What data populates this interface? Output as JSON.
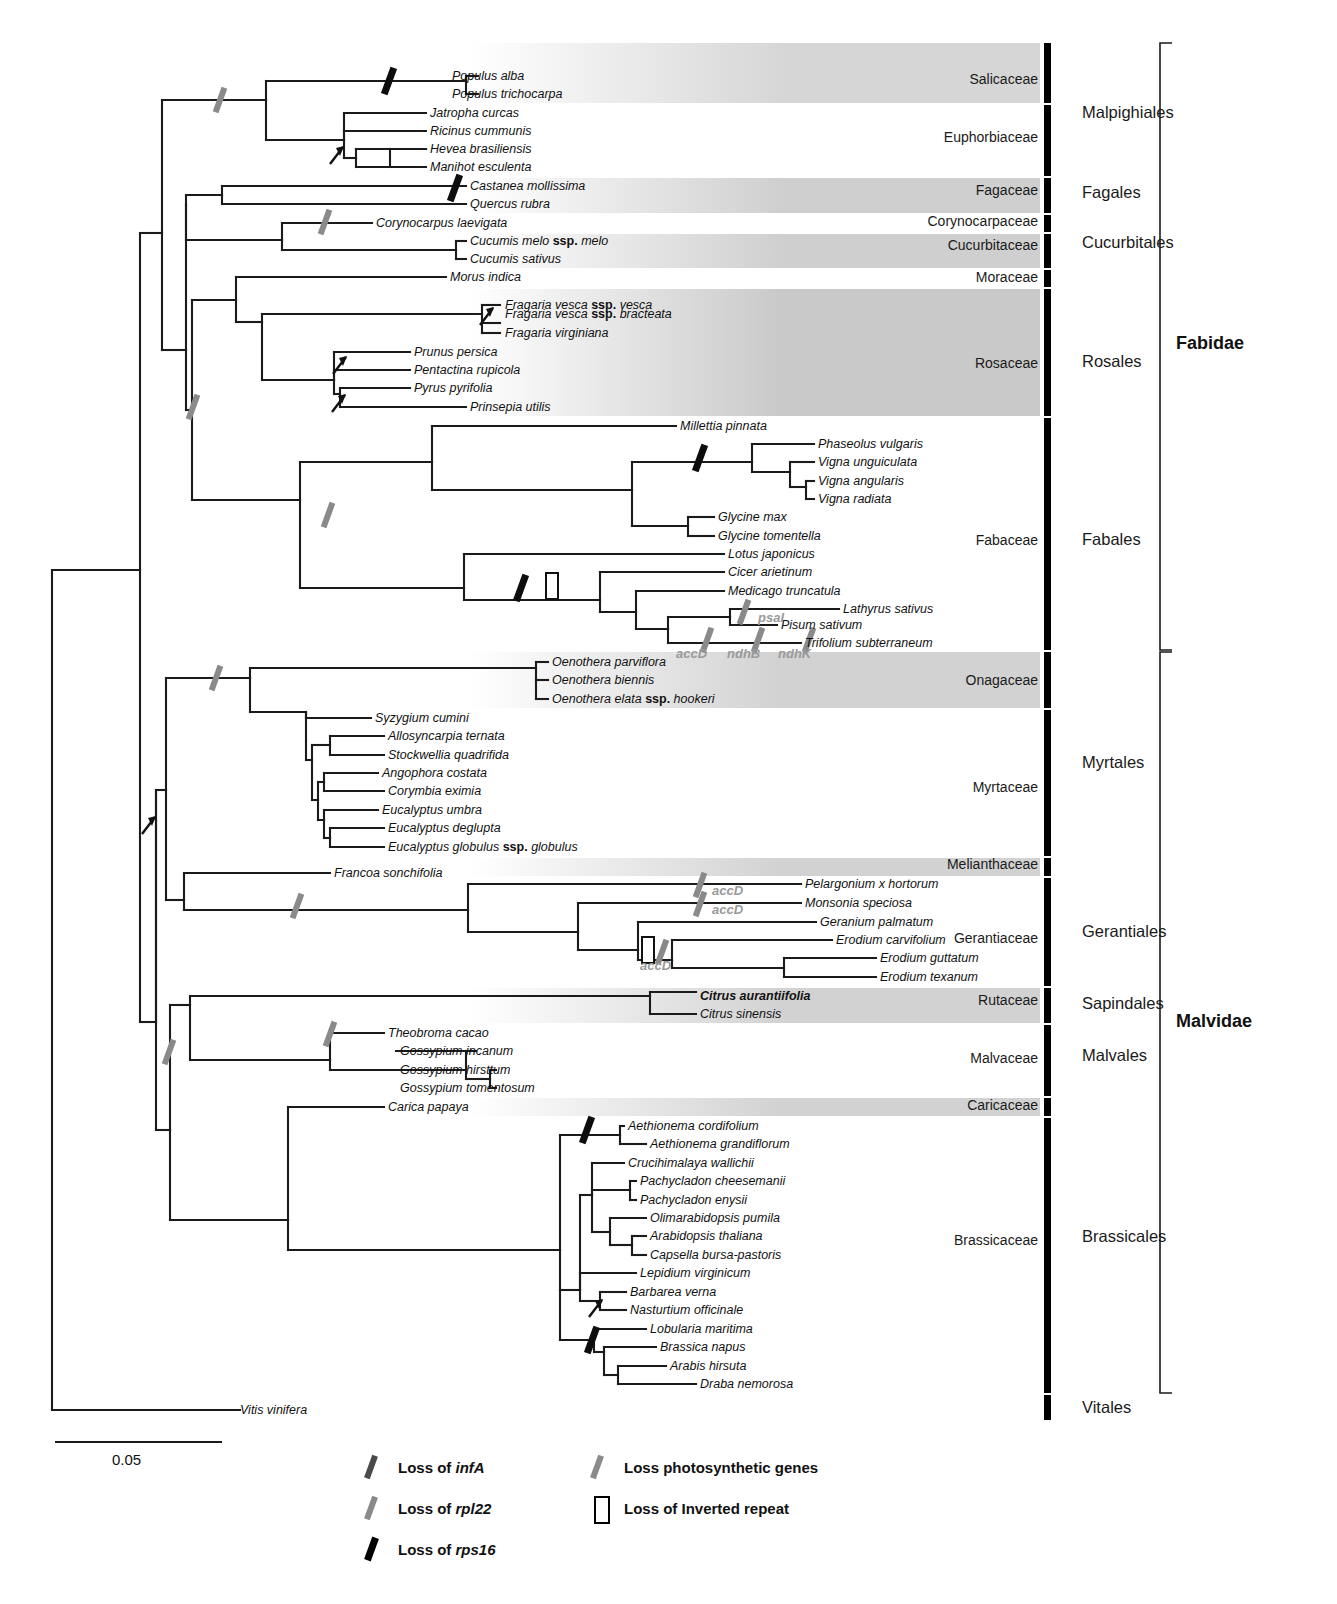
{
  "figure": {
    "type": "phylogenetic-tree",
    "scale_bar": {
      "label": "0.05",
      "x1": 55,
      "x2": 222,
      "y": 1442
    }
  },
  "tips": [
    {
      "name": "Populus alba",
      "x": 452,
      "y": 76,
      "bold": false
    },
    {
      "name": "Populus trichocarpa",
      "x": 452,
      "y": 94,
      "bold": false
    },
    {
      "name": "Jatropha curcas",
      "x": 430,
      "y": 113,
      "bold": false
    },
    {
      "name": "Ricinus cummunis",
      "x": 430,
      "y": 131,
      "bold": false
    },
    {
      "name": "Hevea brasiliensis",
      "x": 430,
      "y": 149,
      "bold": false
    },
    {
      "name": "Manihot esculenta",
      "x": 430,
      "y": 167,
      "bold": false
    },
    {
      "name": "Castanea mollissima",
      "x": 470,
      "y": 186,
      "bold": false
    },
    {
      "name": "Quercus rubra",
      "x": 470,
      "y": 204,
      "bold": false
    },
    {
      "name": "Corynocarpus laevigata",
      "x": 376,
      "y": 223,
      "bold": false
    },
    {
      "name": "Cucumis melo ssp. melo",
      "x": 470,
      "y": 241,
      "bold": false,
      "roman": "ssp."
    },
    {
      "name": "Cucumis sativus",
      "x": 470,
      "y": 259,
      "bold": false
    },
    {
      "name": "Morus indica",
      "x": 450,
      "y": 277,
      "bold": false
    },
    {
      "name": "Fragaria vesca ssp. vesca",
      "x": 505,
      "y": 305,
      "bold": false,
      "roman": "ssp."
    },
    {
      "name": "Fragaria vesca ssp. bracteata",
      "x": 505,
      "y": 314,
      "bold": false,
      "roman": "ssp."
    },
    {
      "name": "Fragaria virginiana",
      "x": 505,
      "y": 333,
      "bold": false
    },
    {
      "name": "Prunus persica",
      "x": 414,
      "y": 352,
      "bold": false
    },
    {
      "name": "Pentactina rupicola",
      "x": 414,
      "y": 370,
      "bold": false
    },
    {
      "name": "Pyrus pyrifolia",
      "x": 414,
      "y": 388,
      "bold": false
    },
    {
      "name": "Prinsepia utilis",
      "x": 470,
      "y": 407,
      "bold": false
    },
    {
      "name": "Millettia pinnata",
      "x": 680,
      "y": 426,
      "bold": false
    },
    {
      "name": "Phaseolus vulgaris",
      "x": 818,
      "y": 444,
      "bold": false
    },
    {
      "name": "Vigna unguiculata",
      "x": 818,
      "y": 462,
      "bold": false
    },
    {
      "name": "Vigna angularis",
      "x": 818,
      "y": 481,
      "bold": false
    },
    {
      "name": "Vigna radiata",
      "x": 818,
      "y": 499,
      "bold": false
    },
    {
      "name": "Glycine max",
      "x": 718,
      "y": 517,
      "bold": false
    },
    {
      "name": "Glycine tomentella",
      "x": 718,
      "y": 536,
      "bold": false
    },
    {
      "name": "Lotus japonicus",
      "x": 728,
      "y": 554,
      "bold": false
    },
    {
      "name": "Cicer arietinum",
      "x": 728,
      "y": 572,
      "bold": false
    },
    {
      "name": "Medicago truncatula",
      "x": 728,
      "y": 591,
      "bold": false
    },
    {
      "name": "Lathyrus sativus",
      "x": 843,
      "y": 609,
      "bold": false
    },
    {
      "name": "Pisum sativum",
      "x": 781,
      "y": 625,
      "bold": false
    },
    {
      "name": "Trifolium subterraneum",
      "x": 805,
      "y": 643,
      "bold": false
    },
    {
      "name": "Oenothera parviflora",
      "x": 552,
      "y": 662,
      "bold": false
    },
    {
      "name": "Oenothera biennis",
      "x": 552,
      "y": 680,
      "bold": false
    },
    {
      "name": "Oenothera elata ssp. hookeri",
      "x": 552,
      "y": 699,
      "bold": false,
      "roman": "ssp."
    },
    {
      "name": "Syzygium cumini",
      "x": 375,
      "y": 718,
      "bold": false
    },
    {
      "name": "Allosyncarpia ternata",
      "x": 388,
      "y": 736,
      "bold": false
    },
    {
      "name": "Stockwellia quadrifida",
      "x": 388,
      "y": 755,
      "bold": false
    },
    {
      "name": "Angophora costata",
      "x": 382,
      "y": 773,
      "bold": false
    },
    {
      "name": "Corymbia eximia",
      "x": 388,
      "y": 791,
      "bold": false
    },
    {
      "name": "Eucalyptus umbra",
      "x": 382,
      "y": 810,
      "bold": false
    },
    {
      "name": "Eucalyptus deglupta",
      "x": 388,
      "y": 828,
      "bold": false
    },
    {
      "name": "Eucalyptus globulus ssp. globulus",
      "x": 388,
      "y": 847,
      "bold": false,
      "roman": "ssp."
    },
    {
      "name": "Francoa sonchifolia",
      "x": 334,
      "y": 873,
      "bold": false
    },
    {
      "name": "Pelargonium x hortorum",
      "x": 805,
      "y": 884,
      "bold": false
    },
    {
      "name": "Monsonia speciosa",
      "x": 805,
      "y": 903,
      "bold": false
    },
    {
      "name": "Geranium palmatum",
      "x": 820,
      "y": 922,
      "bold": false
    },
    {
      "name": "Erodium carvifolium",
      "x": 836,
      "y": 940,
      "bold": false
    },
    {
      "name": "Erodium guttatum",
      "x": 880,
      "y": 958,
      "bold": false
    },
    {
      "name": "Erodium texanum",
      "x": 880,
      "y": 977,
      "bold": false
    },
    {
      "name": "Citrus aurantiifolia",
      "x": 700,
      "y": 996,
      "bold": true
    },
    {
      "name": "Citrus sinensis",
      "x": 700,
      "y": 1014,
      "bold": false
    },
    {
      "name": "Theobroma cacao",
      "x": 388,
      "y": 1033,
      "bold": false
    },
    {
      "name": "Gossypium incanum",
      "x": 400,
      "y": 1051,
      "bold": false
    },
    {
      "name": "Gossypium hirsttum",
      "x": 400,
      "y": 1070,
      "bold": false
    },
    {
      "name": "Gossypium tomentosum",
      "x": 400,
      "y": 1088,
      "bold": false
    },
    {
      "name": "Carica papaya",
      "x": 388,
      "y": 1107,
      "bold": false
    },
    {
      "name": "Aethionema cordifolium",
      "x": 628,
      "y": 1126,
      "bold": false
    },
    {
      "name": "Aethionema grandiflorum",
      "x": 650,
      "y": 1144,
      "bold": false
    },
    {
      "name": "Crucihimalaya wallichii",
      "x": 628,
      "y": 1163,
      "bold": false
    },
    {
      "name": "Pachycladon cheesemanii",
      "x": 640,
      "y": 1181,
      "bold": false
    },
    {
      "name": "Pachycladon enysii",
      "x": 640,
      "y": 1200,
      "bold": false
    },
    {
      "name": "Olimarabidopsis pumila",
      "x": 650,
      "y": 1218,
      "bold": false
    },
    {
      "name": "Arabidopsis thaliana",
      "x": 650,
      "y": 1236,
      "bold": false
    },
    {
      "name": "Capsella bursa-pastoris",
      "x": 650,
      "y": 1255,
      "bold": false
    },
    {
      "name": "Lepidium virginicum",
      "x": 640,
      "y": 1273,
      "bold": false
    },
    {
      "name": "Barbarea verna",
      "x": 630,
      "y": 1292,
      "bold": false
    },
    {
      "name": "Nasturtium officinale",
      "x": 630,
      "y": 1310,
      "bold": false
    },
    {
      "name": "Lobularia maritima",
      "x": 650,
      "y": 1329,
      "bold": false
    },
    {
      "name": "Brassica napus",
      "x": 660,
      "y": 1347,
      "bold": false
    },
    {
      "name": "Arabis hirsuta",
      "x": 670,
      "y": 1366,
      "bold": false
    },
    {
      "name": "Draba nemorosa",
      "x": 700,
      "y": 1384,
      "bold": false
    },
    {
      "name": "Vitis vinifera",
      "x": 240,
      "y": 1410,
      "bold": false
    }
  ],
  "gene_annotations": [
    {
      "text": "psaI",
      "x": 758,
      "y": 618
    },
    {
      "text": "accD",
      "x": 676,
      "y": 654
    },
    {
      "text": "ndhB",
      "x": 727,
      "y": 654
    },
    {
      "text": "ndhK",
      "x": 778,
      "y": 654
    },
    {
      "text": "accD",
      "x": 712,
      "y": 891
    },
    {
      "text": "accD",
      "x": 712,
      "y": 910
    },
    {
      "text": "accD",
      "x": 640,
      "y": 966
    }
  ],
  "families": [
    {
      "label": "Salicaceae",
      "y_top": 43,
      "y_bottom": 103,
      "label_y": 79,
      "shaded": true,
      "shade": "#d6d6d6"
    },
    {
      "label": "Euphorbiaceae",
      "y_top": 105,
      "y_bottom": 176,
      "label_y": 137,
      "shaded": false,
      "shade": "#ffffff"
    },
    {
      "label": "Fagaceae",
      "y_top": 178,
      "y_bottom": 213,
      "label_y": 190,
      "shaded": true,
      "shade": "#cfcfcf"
    },
    {
      "label": "Corynocarpaceae",
      "y_top": 215,
      "y_bottom": 232,
      "label_y": 221,
      "shaded": false,
      "shade": "#ffffff"
    },
    {
      "label": "Cucurbitaceae",
      "y_top": 234,
      "y_bottom": 268,
      "label_y": 245,
      "shaded": true,
      "shade": "#cfcfcf"
    },
    {
      "label": "Moraceae",
      "y_top": 270,
      "y_bottom": 287,
      "label_y": 277,
      "shaded": false,
      "shade": "#ffffff"
    },
    {
      "label": "Rosaceae",
      "y_top": 289,
      "y_bottom": 416,
      "label_y": 363,
      "shaded": true,
      "shade": "#c9c9c9"
    },
    {
      "label": "Fabaceae",
      "y_top": 418,
      "y_bottom": 650,
      "label_y": 540,
      "shaded": false,
      "shade": "#ffffff"
    },
    {
      "label": "Onagaceae",
      "y_top": 652,
      "y_bottom": 708,
      "label_y": 680,
      "shaded": true,
      "shade": "#d2d2d2"
    },
    {
      "label": "Myrtaceae",
      "y_top": 710,
      "y_bottom": 856,
      "label_y": 787,
      "shaded": false,
      "shade": "#ffffff"
    },
    {
      "label": "Melianthaceae",
      "y_top": 858,
      "y_bottom": 876,
      "label_y": 864,
      "shaded": true,
      "shade": "#d2d2d2"
    },
    {
      "label": "Gerantiaceae",
      "y_top": 878,
      "y_bottom": 986,
      "label_y": 938,
      "shaded": false,
      "shade": "#ffffff"
    },
    {
      "label": "Rutaceae",
      "y_top": 988,
      "y_bottom": 1023,
      "label_y": 1000,
      "shaded": true,
      "shade": "#d2d2d2"
    },
    {
      "label": "Malvaceae",
      "y_top": 1025,
      "y_bottom": 1096,
      "label_y": 1058,
      "shaded": false,
      "shade": "#ffffff"
    },
    {
      "label": "Caricaceae",
      "y_top": 1098,
      "y_bottom": 1116,
      "label_y": 1105,
      "shaded": true,
      "shade": "#d2d2d2"
    },
    {
      "label": "Brassicaceae",
      "y_top": 1118,
      "y_bottom": 1393,
      "label_y": 1240,
      "shaded": false,
      "shade": "#ffffff"
    },
    {
      "label": "",
      "y_top": 1395,
      "y_bottom": 1420,
      "label_y": 1408,
      "shaded": false,
      "shade": "#ffffff"
    }
  ],
  "orders": [
    {
      "label": "Malpighiales",
      "y_top": 43,
      "y_bottom": 176,
      "label_y": 113
    },
    {
      "label": "Fagales",
      "y_top": 178,
      "y_bottom": 213,
      "label_y": 193
    },
    {
      "label": "Cucurbitales",
      "y_top": 215,
      "y_bottom": 268,
      "label_y": 243
    },
    {
      "label": "Rosales",
      "y_top": 270,
      "y_bottom": 416,
      "label_y": 362
    },
    {
      "label": "Fabales",
      "y_top": 418,
      "y_bottom": 650,
      "label_y": 540
    },
    {
      "label": "Myrtales",
      "y_top": 652,
      "y_bottom": 856,
      "label_y": 763
    },
    {
      "label": "Gerantiales",
      "y_top": 858,
      "y_bottom": 986,
      "label_y": 932
    },
    {
      "label": "Sapindales",
      "y_top": 988,
      "y_bottom": 1023,
      "label_y": 1004
    },
    {
      "label": "Malvales",
      "y_top": 1025,
      "y_bottom": 1096,
      "label_y": 1056
    },
    {
      "label": "Brassicales",
      "y_top": 1098,
      "y_bottom": 1393,
      "label_y": 1237
    },
    {
      "label": "Vitales",
      "y_top": 1395,
      "y_bottom": 1420,
      "label_y": 1408
    }
  ],
  "clades": [
    {
      "label": "Fabidae",
      "y_top": 43,
      "y_bottom": 650,
      "label_y": 344
    },
    {
      "label": "Malvidae",
      "y_top": 652,
      "y_bottom": 1393,
      "label_y": 1022
    }
  ],
  "legend": {
    "items": [
      {
        "id": "loss-infa",
        "pre": "Loss of ",
        "gene": "infA",
        "type": "slash",
        "color": "#4a4a4a",
        "x": 368,
        "y": 1467,
        "text_x": 398,
        "bold_slash": false
      },
      {
        "id": "loss-rpl22",
        "pre": "Loss of ",
        "gene": "rpl22",
        "type": "slash",
        "color": "#8a8a8a",
        "x": 368,
        "y": 1508,
        "text_x": 398,
        "bold_slash": false
      },
      {
        "id": "loss-rps16",
        "pre": "Loss of ",
        "gene": "rps16",
        "type": "slash",
        "color": "#000000",
        "x": 368,
        "y": 1549,
        "text_x": 398,
        "bold_slash": true
      },
      {
        "id": "loss-photosynthetic",
        "pre": "Loss photosynthetic genes",
        "gene": "",
        "type": "slash",
        "color": "#8a8a8a",
        "x": 594,
        "y": 1467,
        "text_x": 624,
        "bold_slash": false
      },
      {
        "id": "loss-inverted-repeat",
        "pre": "Loss of Inverted repeat",
        "gene": "",
        "type": "box",
        "color": "#000000",
        "x": 594,
        "y": 1508,
        "text_x": 624,
        "bold_slash": false
      }
    ]
  },
  "markers": {
    "description": "Gene-loss event marks placed on tree branches",
    "items": [
      {
        "kind": "photosynthetic",
        "x": 220,
        "y": 100
      },
      {
        "kind": "rps16",
        "x": 389,
        "y": 81
      },
      {
        "kind": "arrow",
        "x": 338,
        "y": 155
      },
      {
        "kind": "rps16",
        "x": 455,
        "y": 188
      },
      {
        "kind": "photosynthetic",
        "x": 325,
        "y": 222
      },
      {
        "kind": "arrow",
        "x": 488,
        "y": 316
      },
      {
        "kind": "arrow",
        "x": 341,
        "y": 365
      },
      {
        "kind": "arrow",
        "x": 340,
        "y": 403
      },
      {
        "kind": "photosynthetic",
        "x": 193,
        "y": 407
      },
      {
        "kind": "photosynthetic",
        "x": 328,
        "y": 515
      },
      {
        "kind": "rps16",
        "x": 700,
        "y": 458
      },
      {
        "kind": "rps16",
        "x": 521,
        "y": 588
      },
      {
        "kind": "ir-box",
        "x": 552,
        "y": 586
      },
      {
        "kind": "photosynthetic",
        "x": 744,
        "y": 612
      },
      {
        "kind": "photosynthetic",
        "x": 707,
        "y": 640
      },
      {
        "kind": "photosynthetic",
        "x": 758,
        "y": 640
      },
      {
        "kind": "photosynthetic",
        "x": 809,
        "y": 640
      },
      {
        "kind": "photosynthetic",
        "x": 216,
        "y": 678
      },
      {
        "kind": "arrow",
        "x": 150,
        "y": 825
      },
      {
        "kind": "photosynthetic",
        "x": 297,
        "y": 906
      },
      {
        "kind": "photosynthetic",
        "x": 700,
        "y": 885
      },
      {
        "kind": "photosynthetic",
        "x": 700,
        "y": 904
      },
      {
        "kind": "ir-box",
        "x": 648,
        "y": 950
      },
      {
        "kind": "photosynthetic",
        "x": 662,
        "y": 952
      },
      {
        "kind": "photosynthetic",
        "x": 169,
        "y": 1052
      },
      {
        "kind": "photosynthetic",
        "x": 330,
        "y": 1034
      },
      {
        "kind": "rps16",
        "x": 587,
        "y": 1130
      },
      {
        "kind": "arrow",
        "x": 597,
        "y": 1308
      },
      {
        "kind": "rps16",
        "x": 592,
        "y": 1340
      }
    ]
  }
}
